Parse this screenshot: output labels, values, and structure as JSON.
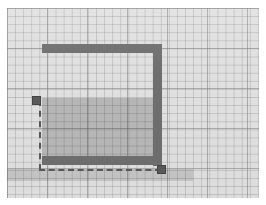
{
  "canvas": {
    "label": "grid-drawing-canvas",
    "grid": {
      "minor_spacing_px": 8,
      "major_spacing_px": 40,
      "background_color": "#e0e0e0",
      "minor_line_color": "#969696",
      "major_line_color": "#7d7d7d"
    },
    "width_px": 252,
    "height_px": 190
  },
  "shape": {
    "name": "u-shaped-wall-outline",
    "stroke_color": "#6e6e6e",
    "wall_thickness_px": 9,
    "segments": [
      {
        "name": "top-wall",
        "orientation": "horizontal",
        "x": 35,
        "y": 36,
        "length": 120
      },
      {
        "name": "right-wall",
        "orientation": "vertical",
        "x": 146,
        "y": 36,
        "length": 122
      },
      {
        "name": "bottom-wall",
        "orientation": "horizontal",
        "x": 35,
        "y": 148,
        "length": 120
      }
    ]
  },
  "region": {
    "name": "shaded-interior-region",
    "fill_color": "#787878",
    "fill_opacity": 0.34,
    "x": 35,
    "y": 90,
    "width": 111,
    "height": 58
  },
  "band": {
    "name": "lower-shaded-band",
    "fill_color": "#787878",
    "fill_opacity": 0.22,
    "x": 35,
    "y": 160,
    "width": 155,
    "height": 12
  },
  "guides": {
    "name": "dashed-construction-guides",
    "color": "#585858",
    "dash_style": "dashed",
    "lines": [
      {
        "name": "vertical-guide",
        "orientation": "vertical",
        "x": 32,
        "y": 92,
        "length": 70
      },
      {
        "name": "horizontal-guide",
        "orientation": "horizontal",
        "x": 32,
        "y": 161,
        "length": 122
      }
    ]
  },
  "handles": [
    {
      "name": "handle-top-left",
      "x": 25,
      "y": 88,
      "size": 9
    },
    {
      "name": "handle-bottom-right",
      "x": 150,
      "y": 157,
      "size": 9
    }
  ]
}
